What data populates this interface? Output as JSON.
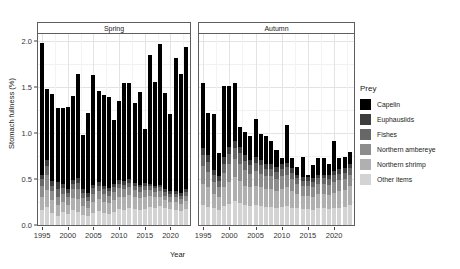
{
  "chart_data": {
    "type": "bar",
    "subtype": "stacked-bar-faceted",
    "title": "",
    "xlabel": "Year",
    "ylabel": "Stomach fullness (%)",
    "ylim": [
      0,
      2.08
    ],
    "y_ticks": [
      "0.0",
      "0.5",
      "1.0",
      "1.5",
      "2.0"
    ],
    "y_tick_values": [
      0.0,
      0.5,
      1.0,
      1.5,
      2.0
    ],
    "x_ticks": [
      "1995",
      "2000",
      "2005",
      "2010",
      "2015",
      "2020"
    ],
    "x_tick_values": [
      1995,
      2000,
      2005,
      2010,
      2015,
      2020
    ],
    "xlim": [
      1994.2,
      2023.8
    ],
    "grid": true,
    "legend_position": "right",
    "legend_title": "Prey",
    "series": [
      {
        "name": "Capelin",
        "color": "#000000"
      },
      {
        "name": "Euphausiids",
        "color": "#3d3d3d"
      },
      {
        "name": "Fishes",
        "color": "#676767"
      },
      {
        "name": "Northern ambereye",
        "color": "#8d8d8d"
      },
      {
        "name": "Northern shrimp",
        "color": "#b0b0b0"
      },
      {
        "name": "Other items",
        "color": "#d3d3d3"
      }
    ],
    "facets": [
      {
        "label": "Spring",
        "categories": [
          1995,
          1996,
          1997,
          1998,
          1999,
          2000,
          2001,
          2002,
          2003,
          2004,
          2005,
          2006,
          2007,
          2008,
          2009,
          2010,
          2011,
          2012,
          2013,
          2014,
          2015,
          2016,
          2017,
          2018,
          2019,
          2020,
          2021,
          2022,
          2023
        ],
        "stacks": {
          "Other items": [
            0.16,
            0.2,
            0.13,
            0.1,
            0.14,
            0.12,
            0.16,
            0.14,
            0.11,
            0.1,
            0.13,
            0.15,
            0.13,
            0.12,
            0.14,
            0.17,
            0.16,
            0.18,
            0.17,
            0.16,
            0.17,
            0.2,
            0.19,
            0.21,
            0.18,
            0.17,
            0.16,
            0.15,
            0.17
          ],
          "Northern shrimp": [
            0.15,
            0.18,
            0.14,
            0.12,
            0.11,
            0.1,
            0.13,
            0.14,
            0.1,
            0.09,
            0.12,
            0.13,
            0.12,
            0.12,
            0.13,
            0.14,
            0.14,
            0.15,
            0.14,
            0.13,
            0.14,
            0.12,
            0.11,
            0.1,
            0.09,
            0.08,
            0.09,
            0.08,
            0.09
          ],
          "Northern ambereye": [
            0.12,
            0.16,
            0.1,
            0.09,
            0.09,
            0.08,
            0.1,
            0.11,
            0.08,
            0.07,
            0.09,
            0.09,
            0.09,
            0.08,
            0.09,
            0.09,
            0.09,
            0.08,
            0.07,
            0.07,
            0.07,
            0.06,
            0.06,
            0.06,
            0.05,
            0.05,
            0.05,
            0.05,
            0.06
          ],
          "Fishes": [
            0.07,
            0.1,
            0.06,
            0.08,
            0.06,
            0.05,
            0.06,
            0.07,
            0.06,
            0.05,
            0.06,
            0.06,
            0.05,
            0.05,
            0.05,
            0.05,
            0.05,
            0.05,
            0.05,
            0.05,
            0.05,
            0.04,
            0.04,
            0.04,
            0.04,
            0.04,
            0.04,
            0.04,
            0.04
          ],
          "Euphausiids": [
            0.05,
            0.07,
            0.05,
            0.08,
            0.05,
            0.04,
            0.04,
            0.05,
            0.04,
            0.04,
            0.04,
            0.04,
            0.04,
            0.03,
            0.04,
            0.04,
            0.04,
            0.04,
            0.03,
            0.03,
            0.03,
            0.03,
            0.03,
            0.03,
            0.03,
            0.03,
            0.03,
            0.03,
            0.03
          ],
          "Capelin": [
            1.43,
            0.77,
            0.95,
            0.81,
            0.83,
            0.9,
            0.92,
            1.14,
            0.59,
            0.87,
            1.19,
            0.99,
            0.99,
            0.99,
            0.69,
            0.86,
            1.07,
            1.05,
            0.87,
            1.01,
            0.59,
            1.4,
            1.13,
            1.53,
            1.05,
            0.84,
            1.45,
            1.29,
            1.55
          ]
        },
        "totals": [
          1.98,
          1.48,
          1.43,
          1.28,
          1.28,
          1.29,
          1.41,
          1.65,
          0.98,
          1.22,
          1.63,
          1.46,
          1.42,
          1.39,
          1.14,
          1.35,
          1.55,
          1.55,
          1.33,
          1.45,
          1.05,
          1.85,
          1.56,
          1.97,
          1.44,
          1.21,
          1.82,
          1.64,
          1.94
        ]
      },
      {
        "label": "Autumn",
        "categories": [
          1995,
          1996,
          1997,
          1998,
          1999,
          2000,
          2001,
          2002,
          2003,
          2004,
          2005,
          2006,
          2007,
          2008,
          2009,
          2010,
          2011,
          2012,
          2013,
          2014,
          2015,
          2016,
          2017,
          2018,
          2019,
          2020,
          2021,
          2022,
          2023
        ],
        "stacks": {
          "Other items": [
            0.22,
            0.2,
            0.18,
            0.16,
            0.21,
            0.23,
            0.26,
            0.24,
            0.22,
            0.21,
            0.22,
            0.21,
            0.2,
            0.2,
            0.19,
            0.2,
            0.21,
            0.19,
            0.18,
            0.17,
            0.17,
            0.16,
            0.18,
            0.18,
            0.17,
            0.18,
            0.19,
            0.2,
            0.22
          ],
          "Northern shrimp": [
            0.23,
            0.21,
            0.16,
            0.14,
            0.2,
            0.24,
            0.26,
            0.24,
            0.21,
            0.2,
            0.21,
            0.2,
            0.19,
            0.19,
            0.18,
            0.19,
            0.2,
            0.18,
            0.16,
            0.15,
            0.15,
            0.15,
            0.16,
            0.16,
            0.16,
            0.17,
            0.18,
            0.18,
            0.2
          ],
          "Northern ambereye": [
            0.19,
            0.17,
            0.13,
            0.11,
            0.16,
            0.19,
            0.2,
            0.19,
            0.17,
            0.15,
            0.16,
            0.15,
            0.14,
            0.14,
            0.13,
            0.14,
            0.14,
            0.13,
            0.11,
            0.1,
            0.1,
            0.1,
            0.11,
            0.11,
            0.11,
            0.12,
            0.12,
            0.12,
            0.13
          ],
          "Fishes": [
            0.12,
            0.11,
            0.08,
            0.07,
            0.1,
            0.11,
            0.12,
            0.11,
            0.1,
            0.09,
            0.09,
            0.09,
            0.08,
            0.08,
            0.08,
            0.08,
            0.08,
            0.07,
            0.06,
            0.06,
            0.06,
            0.06,
            0.06,
            0.06,
            0.06,
            0.07,
            0.07,
            0.07,
            0.07
          ],
          "Euphausiids": [
            0.08,
            0.07,
            0.05,
            0.05,
            0.07,
            0.08,
            0.08,
            0.07,
            0.06,
            0.06,
            0.06,
            0.06,
            0.05,
            0.05,
            0.05,
            0.05,
            0.05,
            0.05,
            0.04,
            0.04,
            0.04,
            0.04,
            0.04,
            0.04,
            0.04,
            0.05,
            0.05,
            0.05,
            0.05
          ],
          "Capelin": [
            0.71,
            0.46,
            0.61,
            0.25,
            0.77,
            0.66,
            0.63,
            0.22,
            0.25,
            0.26,
            0.41,
            0.28,
            0.31,
            0.25,
            0.19,
            0.07,
            0.41,
            0.11,
            0.08,
            0.22,
            0.03,
            0.14,
            0.18,
            0.18,
            0.13,
            0.33,
            0.12,
            0.12,
            0.13
          ]
        },
        "totals": [
          1.55,
          1.22,
          1.21,
          0.78,
          1.51,
          1.51,
          1.55,
          1.07,
          1.01,
          0.97,
          1.15,
          0.99,
          0.97,
          0.91,
          0.82,
          0.73,
          1.09,
          0.73,
          0.63,
          0.74,
          0.55,
          0.65,
          0.73,
          0.73,
          0.67,
          0.92,
          0.73,
          0.74,
          0.8
        ]
      }
    ]
  },
  "axis": {
    "y_title": "Stomach fullness (%)",
    "x_title": "Year"
  },
  "legend": {
    "title": "Prey",
    "items": [
      {
        "label": "Capelin",
        "color": "#000000"
      },
      {
        "label": "Euphausiids",
        "color": "#3d3d3d"
      },
      {
        "label": "Fishes",
        "color": "#676767"
      },
      {
        "label": "Northern ambereye",
        "color": "#8d8d8d"
      },
      {
        "label": "Northern shrimp",
        "color": "#b0b0b0"
      },
      {
        "label": "Other items",
        "color": "#d3d3d3"
      }
    ]
  },
  "panels": [
    {
      "label": "Spring"
    },
    {
      "label": "Autumn"
    }
  ]
}
